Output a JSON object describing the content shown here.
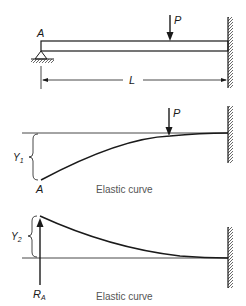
{
  "panel1": {
    "support_label": "A",
    "load_label": "P",
    "span_label": "L"
  },
  "panel2": {
    "load_label": "P",
    "deflection_label": "Y",
    "deflection_sub": "1",
    "end_label": "A",
    "caption": "Elastic curve"
  },
  "panel3": {
    "deflection_label": "Y",
    "deflection_sub": "2",
    "reaction_label": "R",
    "reaction_sub": "A",
    "caption": "Elastic curve"
  },
  "colors": {
    "stroke": "#1a1a1a",
    "caption": "#555555",
    "hatch": "#444444"
  }
}
